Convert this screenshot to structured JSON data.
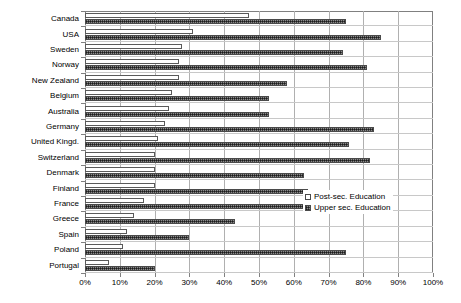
{
  "chart_data": {
    "type": "bar",
    "orientation": "horizontal",
    "title": "",
    "subtitle": "",
    "xlabel": "",
    "ylabel": "",
    "xlim": [
      0,
      100
    ],
    "grid": true,
    "legend_position": "inside-right",
    "categories": [
      "Canada",
      "USA",
      "Sweden",
      "Norway",
      "New Zealand",
      "Belgium",
      "Australia",
      "Germany",
      "United Kingd.",
      "Switzerland",
      "Denmark",
      "Finland",
      "France",
      "Greece",
      "Spain",
      "Poland",
      "Portugal"
    ],
    "series": [
      {
        "name": "Post-sec. Education",
        "style": "white-filled",
        "values": [
          47,
          31,
          28,
          27,
          27,
          25,
          24,
          23,
          21,
          20,
          20,
          20,
          17,
          14,
          12,
          11,
          7
        ]
      },
      {
        "name": "Upper sec. Education",
        "style": "dark-hatched",
        "values": [
          75,
          85,
          74,
          81,
          58,
          53,
          53,
          83,
          76,
          82,
          63,
          64,
          68,
          43,
          30,
          75,
          20
        ]
      }
    ],
    "x_ticks": [
      {
        "value": 0,
        "label": "0%"
      },
      {
        "value": 10,
        "label": "10%"
      },
      {
        "value": 20,
        "label": "20%"
      },
      {
        "value": 30,
        "label": "30%"
      },
      {
        "value": 40,
        "label": "40%"
      },
      {
        "value": 50,
        "label": "50%"
      },
      {
        "value": 60,
        "label": "60%"
      },
      {
        "value": 70,
        "label": "70%"
      },
      {
        "value": 80,
        "label": "80%"
      },
      {
        "value": 90,
        "label": "90%"
      },
      {
        "value": 100,
        "label": "100%"
      }
    ],
    "legend": [
      {
        "label": "Post-sec. Education",
        "swatch": "post"
      },
      {
        "label": "Upper sec. Education",
        "swatch": "upper"
      }
    ],
    "colors": {
      "post_fill": "#ffffff",
      "post_border": "#5a5a5a",
      "upper_fill": "#8c8c8c",
      "upper_border": "#4a4a4a",
      "gridline": "#b0b0b0",
      "frame": "#808080",
      "background": "#ffffff",
      "text": "#000000"
    }
  }
}
